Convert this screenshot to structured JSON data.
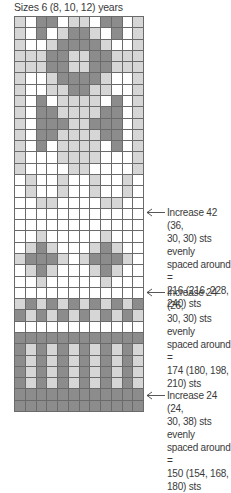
{
  "title": "Sizes 6 (8, 10, 12) years",
  "chart": {
    "columns": 12,
    "rows": 35,
    "legend_colors": {
      "W": "#ffffff",
      "L": "#d6d6d6",
      "D": "#8c8c8c"
    },
    "grid": [
      "LWDDWLLWDDWL",
      "LWDWLDDLWDWL",
      "LWWLDDDDLWWL",
      "LLLDDLLDDLLL",
      "LLLDDLLDDLLL",
      "LWWLDDDDLWWL",
      "LWWLLDDLLWWL",
      "LWDWLLLLWDWL",
      "LWDDLLLLDDWL",
      "LWDDDLLDDDWL",
      "LWDDLLLLDDWL",
      "LWDWLLLLWDWL",
      "LWWWLLLLWWWL",
      "LWWWWLLWWWWL",
      "WLWWLWWLWWLW",
      "WLWWLWWLWWLW",
      "WWLLWWWWLLWW",
      "WWWWWWWWWWWW",
      "WWWWWWWWWWWW",
      "WWLWWWWWLWWW",
      "WLDLWWWLDLWW",
      "LDDDLWLDDDLW",
      "WLDLWWWLDLWW",
      "WWLWWWWWLWWW",
      "WWWWWWWWWWWW",
      "LDLDLDLDLDLD",
      "DLDLDLDLDLDL",
      "WWWWWWWWWWWW",
      "DDDDDDDDDDDD",
      "DLDLDLDLDLDL",
      "DLDLDLDLDLDL",
      "DLDLDLDLDLDL",
      "DLDLDLDLDLDL",
      "DDDDDDDDDDDD",
      "DDDDDDDDDDDD"
    ]
  },
  "annotations": [
    {
      "row": 18,
      "top": 206,
      "lines": [
        "Increase 42 (36,",
        "30, 30) sts evenly",
        "spaced around =",
        "216 (216, 228,",
        "240) sts"
      ]
    },
    {
      "row": 25,
      "top": 286,
      "lines": [
        "Increase 24 (26,",
        "30, 30) sts evenly",
        "spaced around =",
        "174 (180, 198,",
        "210) sts"
      ]
    },
    {
      "row": 34,
      "top": 389,
      "lines": [
        "Increase 24 (24,",
        "30, 38) sts evenly",
        "spaced around =",
        "150 (154, 168,",
        "180) sts"
      ]
    }
  ]
}
